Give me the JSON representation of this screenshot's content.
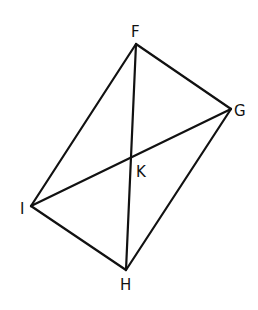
{
  "diagram": {
    "type": "quadrilateral-with-diagonals",
    "stroke_color": "#111111",
    "background": "#ffffff",
    "points": {
      "F": {
        "x": 136,
        "y": 44
      },
      "G": {
        "x": 231,
        "y": 109
      },
      "H": {
        "x": 126,
        "y": 270
      },
      "I": {
        "x": 31,
        "y": 206
      },
      "K": {
        "x": 132,
        "y": 156
      }
    },
    "labels": [
      {
        "id": "F",
        "text": "F",
        "x": 131,
        "y": 37
      },
      {
        "id": "G",
        "text": "G",
        "x": 234,
        "y": 116
      },
      {
        "id": "K",
        "text": "K",
        "x": 136,
        "y": 177
      },
      {
        "id": "I",
        "text": "I",
        "x": 20,
        "y": 214
      },
      {
        "id": "H",
        "text": "H",
        "x": 120,
        "y": 290
      }
    ],
    "edges": [
      {
        "name": "side-FG",
        "from": "F",
        "to": "G"
      },
      {
        "name": "side-GH",
        "from": "G",
        "to": "H"
      },
      {
        "name": "side-HI",
        "from": "H",
        "to": "I"
      },
      {
        "name": "side-IF",
        "from": "I",
        "to": "F"
      },
      {
        "name": "diagonal-FH",
        "from": "F",
        "to": "H"
      },
      {
        "name": "diagonal-IG",
        "from": "I",
        "to": "G"
      }
    ]
  }
}
